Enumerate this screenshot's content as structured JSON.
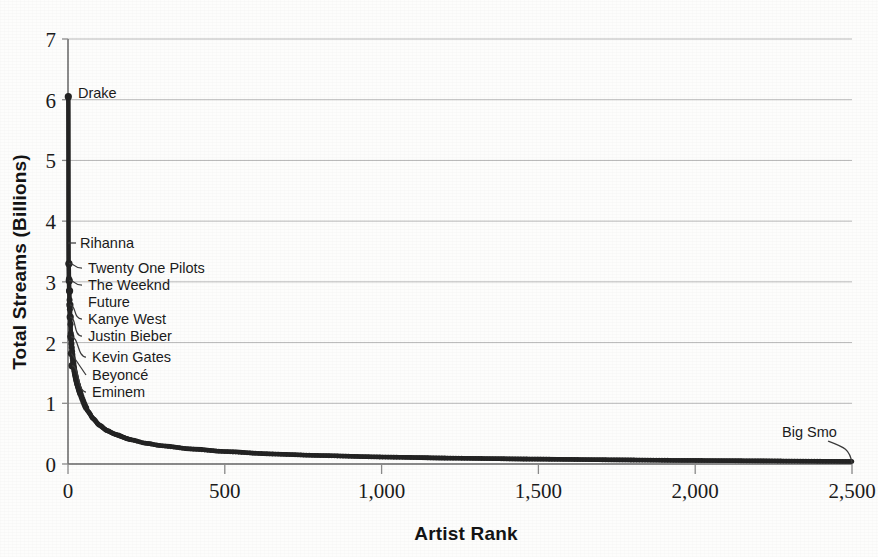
{
  "chart_data": {
    "type": "line",
    "title": "",
    "xlabel": "Artist Rank",
    "ylabel": "Total Streams (Billions)",
    "xlim": [
      0,
      2500
    ],
    "ylim": [
      0,
      7
    ],
    "xticks": [
      "0",
      "500",
      "1,000",
      "1,500",
      "2,000",
      "2,500"
    ],
    "xtick_values": [
      0,
      500,
      1000,
      1500,
      2000,
      2500
    ],
    "yticks": [
      "0",
      "1",
      "2",
      "3",
      "4",
      "5",
      "6",
      "7"
    ],
    "ytick_values": [
      0,
      1,
      2,
      3,
      4,
      5,
      6,
      7
    ],
    "grid": true,
    "legend": "none",
    "marker": "filled-circle",
    "series_name": "Total streams by artist rank",
    "x": [
      1,
      2,
      3,
      4,
      5,
      6,
      7,
      8,
      9,
      10,
      12,
      14,
      16,
      18,
      20,
      24,
      28,
      32,
      38,
      45,
      55,
      65,
      80,
      100,
      125,
      150,
      200,
      250,
      300,
      400,
      500,
      650,
      800,
      1000,
      1250,
      1500,
      1750,
      2000,
      2250,
      2500
    ],
    "values": [
      6.05,
      3.3,
      3.05,
      2.85,
      2.7,
      2.55,
      2.42,
      2.3,
      2.15,
      2.05,
      1.92,
      1.8,
      1.7,
      1.62,
      1.55,
      1.44,
      1.35,
      1.28,
      1.18,
      1.08,
      0.95,
      0.86,
      0.75,
      0.64,
      0.55,
      0.49,
      0.4,
      0.34,
      0.3,
      0.245,
      0.205,
      0.165,
      0.14,
      0.115,
      0.095,
      0.08,
      0.068,
      0.058,
      0.05,
      0.042
    ],
    "annotations": [
      {
        "label": "Drake",
        "rank": 1,
        "value": 6.05,
        "label_x": 78,
        "label_y": 98,
        "leader": "none",
        "dot": true
      },
      {
        "label": "Rihanna",
        "rank": 2,
        "value": 3.55,
        "label_x": 80,
        "label_y": 248,
        "leader": "h-short",
        "dot": false
      },
      {
        "label": "Twenty One Pilots",
        "rank": 3,
        "value": 3.3,
        "label_x": 88,
        "label_y": 273,
        "leader": "hook",
        "dot": true
      },
      {
        "label": "The Weeknd",
        "rank": 4,
        "value": 3.02,
        "label_x": 88,
        "label_y": 290,
        "leader": "hook",
        "dot": true
      },
      {
        "label": "Future",
        "rank": 5,
        "value": 2.85,
        "label_x": 88,
        "label_y": 307,
        "leader": "none",
        "dot": true
      },
      {
        "label": "Kanye West",
        "rank": 6,
        "value": 2.62,
        "label_x": 88,
        "label_y": 324,
        "leader": "hook",
        "dot": true
      },
      {
        "label": "Justin Bieber",
        "rank": 7,
        "value": 2.42,
        "label_x": 88,
        "label_y": 341,
        "leader": "hook",
        "dot": true
      },
      {
        "label": "Kevin Gates",
        "rank": 9,
        "value": 2.1,
        "label_x": 92,
        "label_y": 362,
        "leader": "hook",
        "dot": true
      },
      {
        "label": "Beyoncé",
        "rank": 11,
        "value": 1.82,
        "label_x": 92,
        "label_y": 380,
        "leader": "diag",
        "dot": true
      },
      {
        "label": "Eminem",
        "rank": 13,
        "value": 1.62,
        "label_x": 92,
        "label_y": 397,
        "leader": "hook",
        "dot": true
      },
      {
        "label": "Big Smo",
        "rank": 2500,
        "value": 0.042,
        "label_x": 782,
        "label_y": 437,
        "leader": "hook-right",
        "dot": false
      }
    ]
  },
  "colors": {
    "ink": "#232323",
    "grid": "#b8b8b8",
    "axis": "#6f6f6f",
    "background": "#fdfdfc"
  }
}
